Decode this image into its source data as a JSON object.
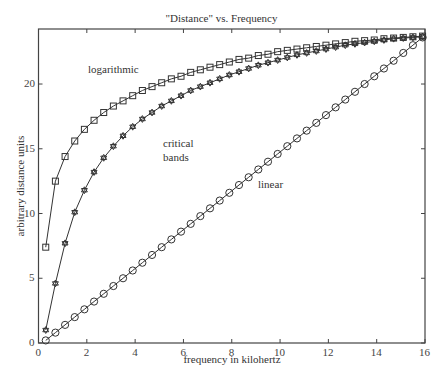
{
  "chart_data": {
    "type": "line",
    "title": "\"Distance\" vs. Frequency",
    "xlabel": "frequency in kilohertz",
    "ylabel": "arbitrary distance units",
    "xlim": [
      0,
      16
    ],
    "ylim": [
      0,
      24.25
    ],
    "xticks": [
      0,
      2,
      4,
      6,
      8,
      10,
      12,
      14,
      16
    ],
    "yticks": [
      0,
      5,
      10,
      15,
      20
    ],
    "grid": false,
    "legend": "none (curves labeled inline)",
    "x": [
      0.3,
      0.7,
      1.1,
      1.5,
      1.9,
      2.3,
      2.7,
      3.1,
      3.5,
      3.9,
      4.3,
      4.7,
      5.1,
      5.5,
      5.9,
      6.3,
      6.7,
      7.1,
      7.5,
      7.9,
      8.3,
      8.7,
      9.1,
      9.5,
      9.9,
      10.3,
      10.7,
      11.1,
      11.5,
      11.9,
      12.3,
      12.7,
      13.1,
      13.5,
      13.9,
      14.3,
      14.7,
      15.1,
      15.5,
      15.9
    ],
    "series": [
      {
        "name": "logarithmic",
        "marker": "square",
        "label_pos": [
          2.0,
          20.5
        ],
        "values": [
          7.4,
          12.5,
          14.4,
          15.6,
          16.5,
          17.2,
          17.8,
          18.3,
          18.7,
          19.1,
          19.5,
          19.8,
          20.1,
          20.4,
          20.6,
          20.9,
          21.1,
          21.3,
          21.5,
          21.7,
          21.9,
          22.0,
          22.2,
          22.3,
          22.5,
          22.6,
          22.7,
          22.8,
          22.9,
          23.0,
          23.1,
          23.2,
          23.3,
          23.35,
          23.4,
          23.5,
          23.55,
          23.6,
          23.65,
          23.7
        ]
      },
      {
        "name": "critical bands",
        "marker": "star",
        "label_pos": [
          5.0,
          16.0
        ],
        "values": [
          1.0,
          4.6,
          7.7,
          10.1,
          11.8,
          13.2,
          14.3,
          15.2,
          16.0,
          16.7,
          17.3,
          17.8,
          18.3,
          18.7,
          19.1,
          19.5,
          19.8,
          20.1,
          20.4,
          20.7,
          20.95,
          21.2,
          21.45,
          21.65,
          21.85,
          22.05,
          22.25,
          22.4,
          22.55,
          22.7,
          22.85,
          23.0,
          23.1,
          23.2,
          23.3,
          23.4,
          23.5,
          23.55,
          23.6,
          23.65
        ]
      },
      {
        "name": "linear",
        "marker": "circle",
        "label_pos": [
          9.5,
          10.5
        ],
        "values": [
          0.2,
          0.8,
          1.4,
          2.0,
          2.6,
          3.2,
          3.8,
          4.4,
          5.0,
          5.6,
          6.2,
          6.8,
          7.4,
          8.0,
          8.6,
          9.2,
          9.8,
          10.4,
          11.0,
          11.6,
          12.2,
          12.8,
          13.4,
          14.0,
          14.6,
          15.2,
          15.8,
          16.4,
          17.0,
          17.6,
          18.2,
          18.8,
          19.4,
          20.0,
          20.6,
          21.2,
          21.8,
          22.4,
          23.0,
          23.6
        ]
      }
    ]
  },
  "labels": {
    "title": "\"Distance\" vs. Frequency",
    "xlabel": "frequency in kilohertz",
    "ylabel": "arbitrary distance units",
    "log_label": "logarithmic",
    "crit_label_1": "critical",
    "crit_label_2": "bands",
    "lin_label": "linear"
  }
}
